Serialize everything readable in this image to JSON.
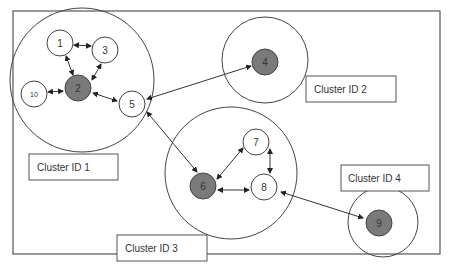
{
  "diagram": {
    "clusters": [
      {
        "id": "cluster-1",
        "label": "Cluster ID 1"
      },
      {
        "id": "cluster-2",
        "label": "Cluster ID 2"
      },
      {
        "id": "cluster-3",
        "label": "Cluster ID 3"
      },
      {
        "id": "cluster-4",
        "label": "Cluster ID 4"
      }
    ],
    "nodes": [
      {
        "id": "1",
        "label": "1",
        "core": false,
        "cluster": 1
      },
      {
        "id": "2",
        "label": "2",
        "core": true,
        "cluster": 1
      },
      {
        "id": "3",
        "label": "3",
        "core": false,
        "cluster": 1
      },
      {
        "id": "4",
        "label": "4",
        "core": true,
        "cluster": 2
      },
      {
        "id": "5",
        "label": "5",
        "core": false,
        "cluster": 1
      },
      {
        "id": "6",
        "label": "6",
        "core": true,
        "cluster": 3
      },
      {
        "id": "7",
        "label": "7",
        "core": false,
        "cluster": 3
      },
      {
        "id": "8",
        "label": "8",
        "core": false,
        "cluster": 3
      },
      {
        "id": "9",
        "label": "9",
        "core": true,
        "cluster": 4
      },
      {
        "id": "10",
        "label": "10",
        "core": false,
        "cluster": 1
      }
    ],
    "edges": [
      {
        "from": "1",
        "to": "3",
        "type": "bidirectional"
      },
      {
        "from": "1",
        "to": "2",
        "type": "bidirectional"
      },
      {
        "from": "3",
        "to": "2",
        "type": "bidirectional"
      },
      {
        "from": "10",
        "to": "2",
        "type": "bidirectional"
      },
      {
        "from": "2",
        "to": "5",
        "type": "bidirectional"
      },
      {
        "from": "5",
        "to": "4",
        "type": "bidirectional"
      },
      {
        "from": "5",
        "to": "6",
        "type": "bidirectional"
      },
      {
        "from": "6",
        "to": "7",
        "type": "bidirectional"
      },
      {
        "from": "6",
        "to": "8",
        "type": "bidirectional"
      },
      {
        "from": "7",
        "to": "8",
        "type": "bidirectional"
      },
      {
        "from": "8",
        "to": "9",
        "type": "bidirectional"
      }
    ],
    "colors": {
      "core_node": "#7a7a7a",
      "stroke": "#444444",
      "background": "#ffffff"
    }
  }
}
